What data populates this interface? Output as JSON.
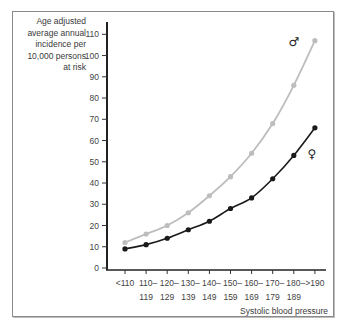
{
  "chart_data": {
    "type": "line",
    "title": "",
    "ylabel": "Age adjusted average annual incidence per 10,000 persons at risk",
    "ylabel_lines": [
      "Age adjusted",
      "average annual",
      "incidence per",
      "10,000 persons",
      "at risk"
    ],
    "xlabel": "Systolic blood pressure",
    "ylim": [
      0,
      110
    ],
    "yticks": [
      0,
      10,
      20,
      30,
      40,
      50,
      60,
      70,
      80,
      90,
      100,
      110
    ],
    "categories": [
      "<110",
      "110–119",
      "120–129",
      "130–139",
      "140–149",
      "150–159",
      "160–169",
      "170–179",
      "180–189",
      ">190"
    ],
    "category_lines": [
      [
        "<110",
        ""
      ],
      [
        "110–",
        "119"
      ],
      [
        "120–",
        "129"
      ],
      [
        "130–",
        "139"
      ],
      [
        "140–",
        "149"
      ],
      [
        "150–",
        "159"
      ],
      [
        "160–",
        "169"
      ],
      [
        "170–",
        "179"
      ],
      [
        "180–",
        "189"
      ],
      [
        ">190",
        ""
      ]
    ],
    "grid": false,
    "legend": "inline symbols at line ends",
    "series": [
      {
        "name": "Men",
        "symbol": "♂",
        "color": "#bdbdbd",
        "values": [
          12,
          16,
          20,
          26,
          34,
          43,
          54,
          68,
          86,
          107
        ]
      },
      {
        "name": "Women",
        "symbol": "♀",
        "color": "#1a1a1a",
        "values": [
          9,
          11,
          14,
          18,
          22,
          28,
          33,
          42,
          53,
          66
        ]
      }
    ]
  }
}
